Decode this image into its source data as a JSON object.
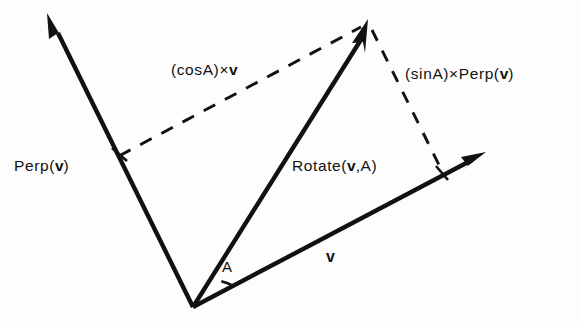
{
  "diagram": {
    "background_color": "#fdfdfd",
    "ink_color": "#111111",
    "labels": {
      "perp_v": {
        "prefix": "Perp(",
        "vector": "v",
        "suffix": ")"
      },
      "cos_a_times_v": {
        "prefix": "(cosA)×",
        "vector": "v",
        "suffix": ""
      },
      "sin_a_times_perp_v": {
        "prefix": "(sinA)×Perp(",
        "vector": "v",
        "suffix": ")"
      },
      "rotate_v_a": {
        "prefix": "Rotate(",
        "vector": "v",
        "suffix": ",A)"
      },
      "v_vector": "v",
      "angle": "A"
    },
    "geometry": {
      "origin": {
        "x": 193,
        "y": 307
      },
      "vectors": [
        {
          "name": "v",
          "tip": {
            "x": 483,
            "y": 155
          },
          "style": "solid",
          "arrow": true
        },
        {
          "name": "Perp(v)",
          "tip": {
            "x": 50,
            "y": 17
          },
          "style": "solid",
          "arrow": true
        },
        {
          "name": "Rotate(v,A)",
          "tip": {
            "x": 367,
            "y": 22
          },
          "style": "solid",
          "arrow": true
        }
      ],
      "dashed_segments": [
        {
          "name": "cosA-component",
          "from": {
            "x": 120,
            "y": 155
          },
          "to": {
            "x": 360,
            "y": 28
          }
        },
        {
          "name": "sinA-component",
          "from": {
            "x": 372,
            "y": 30
          },
          "to": {
            "x": 443,
            "y": 172
          }
        }
      ],
      "tick_marks": [
        {
          "name": "perp-tick",
          "x": 120,
          "y": 155
        },
        {
          "name": "v-tick",
          "x": 443,
          "y": 172
        }
      ],
      "angle_arc": {
        "center": {
          "x": 193,
          "y": 307
        },
        "radius": 44,
        "label_at": {
          "x": 227,
          "y": 266
        }
      }
    }
  }
}
